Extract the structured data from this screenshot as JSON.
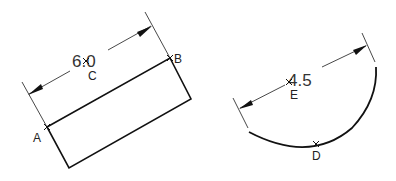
{
  "figures": [
    {
      "name": "rectangle-figure",
      "dimension_text": "6.0",
      "points": [
        {
          "label": "A"
        },
        {
          "label": "B"
        },
        {
          "label": "C"
        }
      ]
    },
    {
      "name": "arc-figure",
      "dimension_text": "4.5",
      "points": [
        {
          "label": "D"
        },
        {
          "label": "E"
        }
      ]
    }
  ],
  "colors": {
    "line": "#111111",
    "thin_line": "#333333",
    "background": "#ffffff"
  }
}
